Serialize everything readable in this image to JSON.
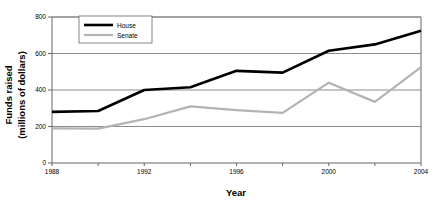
{
  "chart_data": {
    "type": "line",
    "title": "",
    "xlabel": "Year",
    "ylabel": "Funds raised (millions of dollars)",
    "ylabel_line1": "Funds raised",
    "ylabel_line2": "(millions of dollars)",
    "x": [
      1988,
      1990,
      1992,
      1994,
      1996,
      1998,
      2000,
      2002,
      2004
    ],
    "xlim": [
      1988,
      2004
    ],
    "ylim": [
      0,
      800
    ],
    "yticks": [
      0,
      200,
      400,
      600,
      800
    ],
    "ytick_labels": [
      "0",
      "200",
      "400",
      "600",
      "800"
    ],
    "xticks": [
      1988,
      1990,
      1992,
      1994,
      1996,
      1998,
      2000,
      2002,
      2004
    ],
    "xtick_labels_shown": [
      "1988",
      "1992",
      "1996",
      "2000",
      "2004"
    ],
    "xtick_label_values": [
      1988,
      1992,
      1996,
      2000,
      2004
    ],
    "grid": "horizontal",
    "legend_position": "top-left-inside",
    "series": [
      {
        "name": "House",
        "color": "#000000",
        "width": 2.6,
        "values": [
          280,
          285,
          400,
          415,
          505,
          495,
          615,
          650,
          725
        ]
      },
      {
        "name": "Senate",
        "color": "#b3b3b3",
        "width": 2.2,
        "values": [
          190,
          188,
          240,
          310,
          290,
          275,
          440,
          335,
          525
        ]
      }
    ]
  },
  "legend": {
    "entries": [
      {
        "label": "House"
      },
      {
        "label": "Senate"
      }
    ]
  },
  "colors": {
    "house": "#000000",
    "senate": "#b3b3b3",
    "axis": "#555555",
    "grid": "#808080",
    "background": "#ffffff"
  }
}
